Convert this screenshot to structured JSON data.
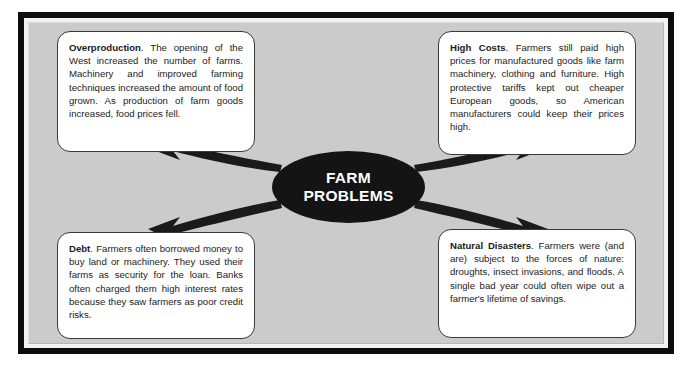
{
  "diagram": {
    "hub": {
      "line1": "FARM",
      "line2": "PROBLEMS",
      "shape": "ellipse",
      "fill_color": "#141414",
      "text_color": "#ffffff"
    },
    "background_color": "#cbcbcb",
    "frame_color": "#0d0d0d",
    "box_fill_color": "#ffffff",
    "arrow_color": "#1a1a1a",
    "nodes": [
      {
        "id": "overproduction",
        "position": "top-left",
        "heading": "Overproduction",
        "body": ". The opening of the West increased the number of farms. Machinery and improved farming techniques increased the amount of food grown. As production of farm goods increased, food prices fell."
      },
      {
        "id": "high-costs",
        "position": "top-right",
        "heading": "High Costs",
        "body": ". Farmers still paid high prices for manufactured goods like farm machinery, clothing and furniture. High protective tariffs kept out cheaper European goods, so American manufacturers could keep their prices high."
      },
      {
        "id": "debt",
        "position": "bottom-left",
        "heading": "Debt",
        "body": ". Farmers often borrowed money to buy land or machinery. They used their farms as security for the loan. Banks often charged them high interest rates because they saw farmers as poor credit risks."
      },
      {
        "id": "natural-disasters",
        "position": "bottom-right",
        "heading": "Natural Disasters",
        "body": ". Farmers were (and are) subject to the forces of nature: droughts, insect invasions, and floods. A single bad year could often wipe out a farmer's lifetime of savings."
      }
    ],
    "arrows": [
      {
        "id": "arrow-to-overproduction",
        "from": "hub",
        "to": "overproduction",
        "direction": "up-left"
      },
      {
        "id": "arrow-to-high-costs",
        "from": "hub",
        "to": "high-costs",
        "direction": "up-right"
      },
      {
        "id": "arrow-to-debt",
        "from": "hub",
        "to": "debt",
        "direction": "down-left"
      },
      {
        "id": "arrow-to-natural-disasters",
        "from": "hub",
        "to": "natural-disasters",
        "direction": "down-right"
      }
    ]
  }
}
